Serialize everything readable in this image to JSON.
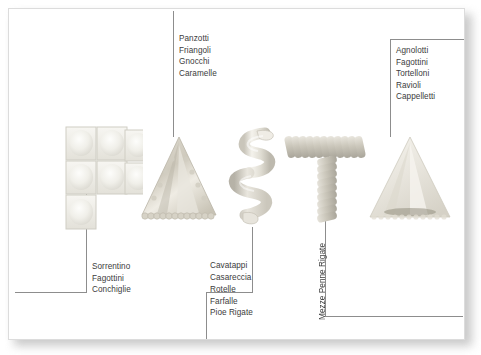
{
  "figure": {
    "title_word": "PASTA",
    "letters": [
      {
        "letter": "P",
        "icon": "pasta-letter-p-sorrentino-squares"
      },
      {
        "letter": "A",
        "icon": "pasta-letter-a-triangle-crimped"
      },
      {
        "letter": "S",
        "icon": "pasta-letter-s-spiral-ribbon"
      },
      {
        "letter": "T",
        "icon": "pasta-letter-t-penne-rigate"
      },
      {
        "letter": "A",
        "icon": "pasta-letter-a2-triangle-smooth"
      }
    ],
    "background_color": "#ffffff",
    "frame_border_color": "#dcdcdc",
    "leader_line_color": "#8d8d8d",
    "text_color": "#3c3c3c"
  },
  "callouts": {
    "top_center": {
      "name": "panzotti-group",
      "orientation": "horizontal",
      "items": [
        "Panzotti",
        "Friangoli",
        "Gnocchi",
        "Caramelle"
      ]
    },
    "top_right": {
      "name": "agnolotti-group",
      "orientation": "horizontal",
      "items": [
        "Agnolotti",
        "Fagottini",
        "Tortelloni",
        "Ravioli",
        "Cappelletti"
      ]
    },
    "bottom_left": {
      "name": "sorrentino-group",
      "orientation": "horizontal",
      "items": [
        "Sorrentino",
        "Fagottini",
        "Conchiglie"
      ]
    },
    "bottom_center_upper": {
      "name": "cavatappi-group",
      "orientation": "horizontal",
      "items": [
        "Cavatappi",
        "Casareccia"
      ]
    },
    "bottom_center_lower": {
      "name": "rotelle-group",
      "orientation": "horizontal",
      "items": [
        "Rotelle",
        "Farfalle",
        "Pioe Rigate"
      ]
    },
    "vertical_center": {
      "name": "mezze-penne-rigate-label",
      "orientation": "vertical",
      "items": [
        "Mezze Penne Rigate"
      ]
    }
  }
}
